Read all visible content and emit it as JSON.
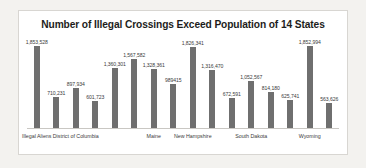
{
  "chart_data": {
    "type": "bar",
    "title": "Number of Illegal Crossings Exceed Population of 14 States",
    "xlabel": "",
    "ylabel": "",
    "ylim": [
      0,
      1853528
    ],
    "grid": false,
    "legend": "none",
    "orientation": "vertical",
    "bar_color": "#6f6f6f",
    "categories": [
      "Illegal Aliens",
      "",
      "District of Columbia",
      "",
      "",
      "",
      "Maine",
      "",
      "New Hampshire",
      "",
      "",
      "South Dakota",
      "",
      "",
      "Wyoming",
      ""
    ],
    "values": [
      1853528,
      710231,
      897934,
      601723,
      1360301,
      1567582,
      1328361,
      989415,
      1826341,
      1316470,
      672591,
      1052567,
      814180,
      625741,
      1852994,
      563626
    ],
    "data_labels": [
      "1,853,528",
      "710,231",
      "897,934",
      "601,723",
      "1,360,301",
      "1,567,582",
      "1,328,361",
      "989415",
      "1,826,341",
      "1,316,470",
      "672,591",
      "1,052,567",
      "814,180",
      "625,741",
      "1,852,994",
      "563,626"
    ],
    "tick_labels": [
      {
        "index": 0,
        "text": "Illegal Aliens"
      },
      {
        "index": 2,
        "text": "District of Columbia"
      },
      {
        "index": 6,
        "text": "Maine"
      },
      {
        "index": 8,
        "text": "New Hampshire"
      },
      {
        "index": 11,
        "text": "South Dakota"
      },
      {
        "index": 14,
        "text": "Wyoming"
      }
    ]
  }
}
